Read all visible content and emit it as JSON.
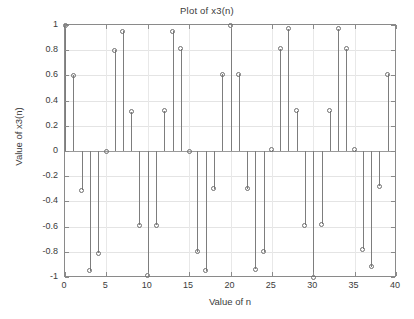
{
  "chart_data": {
    "type": "scatter",
    "plot_style": "stem",
    "title": "Plot of x3(n)",
    "xlabel": "Value of n",
    "ylabel": "Value of x3(n)",
    "xlim": [
      0,
      40
    ],
    "ylim": [
      -1,
      1
    ],
    "grid": true,
    "legend": null,
    "xticks": [
      0,
      5,
      10,
      15,
      20,
      25,
      30,
      35,
      40
    ],
    "xtick_labels": [
      "0",
      "5",
      "10",
      "15",
      "20",
      "25",
      "30",
      "35",
      "40"
    ],
    "yticks": [
      1,
      0.8,
      0.6,
      0.4,
      0.2,
      0,
      -0.2,
      -0.4,
      -0.6,
      -0.8,
      -1
    ],
    "ytick_labels": [
      "1",
      "0.8",
      "0.6",
      "0.4",
      "0.2",
      "0",
      "-0.2",
      "-0.4",
      "-0.6",
      "-0.8",
      "-1"
    ],
    "series_name": "x3(n)",
    "x": [
      0,
      1,
      2,
      3,
      4,
      5,
      6,
      7,
      8,
      9,
      10,
      11,
      12,
      13,
      14,
      15,
      16,
      17,
      18,
      19,
      20,
      21,
      22,
      23,
      24,
      25,
      26,
      27,
      28,
      29,
      30,
      31,
      32,
      33,
      34,
      35,
      36,
      37,
      38,
      39
    ],
    "values": [
      1.0,
      0.6,
      -0.31,
      -0.95,
      -0.81,
      0.0,
      0.8,
      0.95,
      0.31,
      -0.59,
      -0.99,
      -0.59,
      0.32,
      0.95,
      0.81,
      0.0,
      -0.8,
      -0.95,
      -0.3,
      0.61,
      1.0,
      0.61,
      -0.3,
      -0.94,
      -0.8,
      0.01,
      0.81,
      0.97,
      0.32,
      -0.59,
      -1.0,
      -0.58,
      0.32,
      0.97,
      0.81,
      0.01,
      -0.78,
      -0.92,
      -0.28,
      0.61
    ],
    "marker": "circle-open",
    "marker_color": "#6e6e6e",
    "line_color": "#7d7d7d",
    "axis_color": "#8a8a8a",
    "grid_color": "#e4e4e4",
    "text_color": "#3b3b3b",
    "background": "#ffffff"
  }
}
